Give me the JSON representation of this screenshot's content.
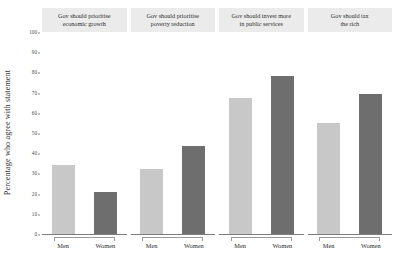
{
  "chart_data": {
    "type": "bar",
    "title": "",
    "subtitle": "",
    "xlabel": "",
    "ylabel": "Percentage who agree with statement",
    "ylim": [
      0,
      100
    ],
    "ytick_labels": [
      "0",
      "10",
      "20",
      "30",
      "40",
      "50",
      "60",
      "70",
      "80",
      "90",
      "100"
    ],
    "ytick_values": [
      0,
      10,
      20,
      30,
      40,
      50,
      60,
      70,
      80,
      90,
      100
    ],
    "grid": false,
    "legend": "none",
    "categories": [
      "Men",
      "Women"
    ],
    "facet_variable": "statement",
    "colors": {
      "men_bar": "#c8c8c8",
      "women_bar": "#6e6e6e",
      "panel_header_bg": "#ebebeb",
      "axis_line": "#7d7d7d",
      "text": "#2b2b2b",
      "background": "#ffffff"
    },
    "panels": [
      {
        "title": "Gov should prioritise economic growth",
        "title_line1": "Gov should prioritise",
        "title_line2": "economic growth",
        "categories": [
          "Men",
          "Women"
        ],
        "values": [
          34,
          21
        ]
      },
      {
        "title": "Gov should prioritise poverty reduction",
        "title_line1": "Gov should prioritise",
        "title_line2": "poverty reduction",
        "categories": [
          "Men",
          "Women"
        ],
        "values": [
          32,
          43.5
        ]
      },
      {
        "title": "Gov should invest more in public services",
        "title_line1": "Gov should invest more",
        "title_line2": "in public services",
        "categories": [
          "Men",
          "Women"
        ],
        "values": [
          67.5,
          78
        ]
      },
      {
        "title": "Gov should tax the rich",
        "title_line1": "Gov should tax",
        "title_line2": "the rich",
        "categories": [
          "Men",
          "Women"
        ],
        "values": [
          55,
          69.5
        ]
      }
    ]
  }
}
